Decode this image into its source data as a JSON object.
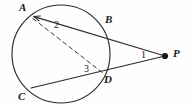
{
  "figure": {
    "background_color": "#fefefe",
    "stroke_color": "#2b2b2b",
    "label_color": "#1a1a1a",
    "width": 193,
    "height": 110
  },
  "circle": {
    "name": "circle",
    "center_x": 61,
    "center_y": 54,
    "radius": 49
  },
  "points": [
    {
      "id": "A",
      "label": "A",
      "x": 31,
      "y": 16,
      "label_x": 19,
      "label_y": 2,
      "marked": false
    },
    {
      "id": "B",
      "label": "B",
      "x": 102,
      "y": 28,
      "label_x": 105,
      "label_y": 14,
      "marked": false
    },
    {
      "id": "C",
      "label": "C",
      "x": 31,
      "y": 88,
      "label_x": 18,
      "label_y": 91,
      "marked": false
    },
    {
      "id": "D",
      "label": "D",
      "x": 103,
      "y": 73,
      "label_x": 104,
      "label_y": 74,
      "marked": false
    },
    {
      "id": "P",
      "label": "P",
      "x": 165,
      "y": 56,
      "label_x": 173,
      "label_y": 48,
      "marked": true
    }
  ],
  "segments": [
    {
      "id": "AP",
      "from": "A",
      "to": "P",
      "style": "solid",
      "arrow_at_start": true
    },
    {
      "id": "CP",
      "from": "C",
      "to": "P",
      "style": "solid",
      "arrow_at_start": false
    },
    {
      "id": "AD",
      "from": "A",
      "to": "D",
      "style": "dashed",
      "arrow_at_start": false
    }
  ],
  "angles": [
    {
      "id": "angle-1",
      "label": "1",
      "at": "P",
      "x": 141,
      "y": 50
    },
    {
      "id": "angle-2",
      "label": "2",
      "at": "A",
      "x": 54,
      "y": 20
    },
    {
      "id": "angle-3",
      "label": "3",
      "at": "D",
      "x": 84,
      "y": 64
    }
  ]
}
